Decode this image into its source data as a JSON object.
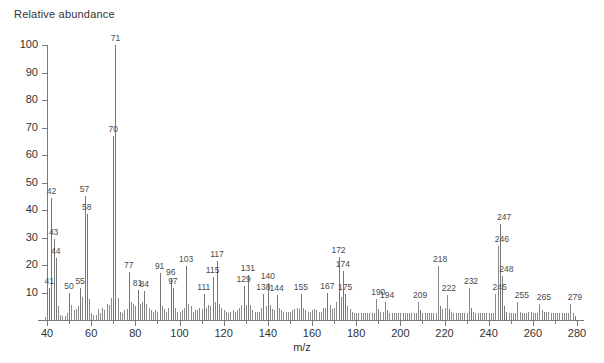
{
  "chart_data": {
    "type": "bar",
    "title": "",
    "ylabel": "Relative abundance",
    "xlabel": "m/z",
    "xlim": [
      36,
      284
    ],
    "ylim": [
      0,
      100
    ],
    "grid": false,
    "legend": null,
    "xticks": [
      40,
      60,
      80,
      100,
      120,
      140,
      160,
      180,
      200,
      220,
      240,
      260,
      280
    ],
    "yticks": [
      0,
      10,
      20,
      30,
      40,
      50,
      60,
      70,
      80,
      90,
      100
    ],
    "x": [
      39,
      40,
      41,
      42,
      43,
      44,
      45,
      46,
      47,
      48,
      49,
      50,
      51,
      52,
      53,
      54,
      55,
      56,
      57,
      58,
      59,
      60,
      61,
      62,
      63,
      64,
      65,
      66,
      67,
      68,
      69,
      70,
      71,
      72,
      73,
      74,
      75,
      76,
      77,
      78,
      79,
      80,
      81,
      82,
      83,
      84,
      85,
      86,
      87,
      88,
      89,
      90,
      91,
      92,
      93,
      94,
      95,
      96,
      97,
      98,
      99,
      100,
      101,
      102,
      103,
      104,
      105,
      106,
      107,
      108,
      109,
      110,
      111,
      112,
      113,
      114,
      115,
      116,
      117,
      118,
      119,
      120,
      121,
      122,
      123,
      124,
      125,
      126,
      127,
      128,
      129,
      130,
      131,
      132,
      133,
      134,
      135,
      136,
      137,
      138,
      139,
      140,
      141,
      142,
      143,
      144,
      145,
      146,
      147,
      148,
      149,
      150,
      151,
      152,
      153,
      154,
      155,
      156,
      157,
      158,
      159,
      160,
      161,
      162,
      163,
      164,
      165,
      166,
      167,
      168,
      169,
      170,
      171,
      172,
      173,
      174,
      175,
      176,
      177,
      178,
      179,
      180,
      181,
      182,
      183,
      184,
      185,
      186,
      187,
      188,
      189,
      190,
      191,
      192,
      193,
      194,
      195,
      196,
      197,
      198,
      199,
      200,
      201,
      202,
      203,
      204,
      205,
      206,
      207,
      208,
      209,
      210,
      211,
      212,
      213,
      214,
      215,
      216,
      217,
      218,
      219,
      220,
      221,
      222,
      223,
      224,
      225,
      226,
      227,
      228,
      229,
      230,
      231,
      232,
      233,
      234,
      235,
      236,
      237,
      238,
      239,
      240,
      241,
      242,
      243,
      244,
      245,
      246,
      247,
      248,
      249,
      250,
      251,
      252,
      253,
      254,
      255,
      256,
      257,
      258,
      259,
      260,
      261,
      262,
      263,
      264,
      265,
      266,
      267,
      268,
      269,
      270,
      271,
      272,
      273,
      274,
      275,
      276,
      277,
      278,
      279,
      280,
      281
    ],
    "y": [
      1.2,
      2.0,
      11.5,
      44.5,
      29.5,
      22.5,
      5.0,
      2.0,
      1.5,
      1.5,
      2.5,
      10.0,
      5.5,
      3.5,
      4.0,
      5.0,
      11.5,
      8.5,
      45.0,
      38.5,
      7.5,
      2.5,
      2.0,
      2.0,
      4.0,
      2.5,
      4.5,
      3.5,
      6.0,
      5.5,
      8.0,
      67.0,
      100.0,
      8.0,
      3.0,
      2.5,
      3.5,
      4.0,
      17.5,
      6.5,
      6.0,
      5.0,
      11.0,
      6.0,
      6.5,
      10.5,
      6.0,
      4.5,
      3.5,
      3.0,
      3.5,
      3.0,
      17.0,
      5.0,
      4.0,
      3.0,
      4.5,
      15.0,
      11.5,
      4.5,
      3.0,
      3.0,
      3.5,
      4.5,
      19.5,
      6.0,
      5.0,
      3.0,
      3.5,
      3.5,
      4.5,
      4.0,
      9.5,
      4.5,
      5.5,
      5.0,
      15.5,
      6.5,
      21.5,
      6.0,
      4.5,
      3.5,
      3.0,
      2.5,
      3.0,
      3.5,
      3.0,
      3.5,
      4.5,
      5.5,
      12.5,
      5.5,
      16.5,
      5.5,
      3.5,
      3.0,
      3.0,
      3.0,
      4.5,
      9.5,
      5.0,
      13.5,
      5.5,
      4.0,
      3.5,
      9.0,
      4.5,
      3.5,
      3.0,
      3.0,
      3.0,
      3.0,
      3.5,
      4.0,
      4.5,
      4.0,
      9.5,
      4.5,
      3.5,
      3.0,
      3.0,
      3.5,
      4.0,
      3.5,
      3.0,
      3.0,
      4.5,
      4.5,
      10.0,
      5.5,
      4.0,
      4.5,
      6.5,
      23.0,
      8.5,
      18.0,
      9.5,
      5.0,
      4.0,
      3.0,
      2.5,
      2.5,
      2.5,
      2.5,
      2.5,
      2.5,
      2.5,
      2.5,
      2.5,
      2.5,
      7.5,
      4.0,
      3.0,
      3.0,
      6.5,
      3.5,
      2.5,
      2.5,
      2.5,
      2.5,
      2.5,
      2.5,
      2.5,
      2.5,
      2.5,
      2.5,
      2.5,
      2.5,
      2.5,
      6.5,
      3.5,
      2.5,
      2.5,
      2.5,
      2.5,
      2.5,
      2.5,
      2.5,
      19.5,
      5.0,
      4.0,
      4.5,
      9.0,
      4.0,
      3.0,
      2.5,
      2.5,
      2.5,
      2.5,
      2.5,
      2.5,
      2.5,
      11.5,
      4.5,
      3.0,
      2.5,
      2.5,
      2.5,
      2.5,
      2.5,
      2.5,
      2.5,
      2.5,
      2.5,
      9.5,
      27.0,
      35.0,
      16.0,
      5.0,
      3.0,
      2.5,
      2.5,
      2.5,
      2.5,
      6.5,
      3.0,
      2.5,
      2.5,
      2.5,
      3.0,
      3.0,
      2.5,
      2.5,
      2.5,
      6.0,
      3.5,
      3.0,
      3.0,
      3.0,
      2.5,
      2.5,
      2.5,
      2.5,
      2.5,
      2.5,
      2.5,
      2.5,
      2.5,
      6.0,
      2.5,
      1.5
    ],
    "labeled_peaks": [
      {
        "mz": 41,
        "intensity": 11.5
      },
      {
        "mz": 42,
        "intensity": 44.5
      },
      {
        "mz": 43,
        "intensity": 29.5
      },
      {
        "mz": 44,
        "intensity": 22.5
      },
      {
        "mz": 50,
        "intensity": 10.0
      },
      {
        "mz": 55,
        "intensity": 11.5
      },
      {
        "mz": 57,
        "intensity": 45.0
      },
      {
        "mz": 58,
        "intensity": 38.5
      },
      {
        "mz": 70,
        "intensity": 67.0
      },
      {
        "mz": 71,
        "intensity": 100.0
      },
      {
        "mz": 77,
        "intensity": 17.5
      },
      {
        "mz": 81,
        "intensity": 11.0
      },
      {
        "mz": 84,
        "intensity": 10.5
      },
      {
        "mz": 91,
        "intensity": 17.0
      },
      {
        "mz": 96,
        "intensity": 15.0
      },
      {
        "mz": 97,
        "intensity": 11.5
      },
      {
        "mz": 103,
        "intensity": 19.5
      },
      {
        "mz": 111,
        "intensity": 9.5
      },
      {
        "mz": 115,
        "intensity": 15.5
      },
      {
        "mz": 117,
        "intensity": 21.5
      },
      {
        "mz": 129,
        "intensity": 12.5
      },
      {
        "mz": 131,
        "intensity": 16.5
      },
      {
        "mz": 138,
        "intensity": 9.5
      },
      {
        "mz": 140,
        "intensity": 13.5
      },
      {
        "mz": 144,
        "intensity": 9.0
      },
      {
        "mz": 155,
        "intensity": 9.5
      },
      {
        "mz": 167,
        "intensity": 10.0
      },
      {
        "mz": 172,
        "intensity": 23.0
      },
      {
        "mz": 174,
        "intensity": 18.0
      },
      {
        "mz": 175,
        "intensity": 9.5
      },
      {
        "mz": 190,
        "intensity": 7.5
      },
      {
        "mz": 194,
        "intensity": 6.5
      },
      {
        "mz": 209,
        "intensity": 6.5
      },
      {
        "mz": 218,
        "intensity": 19.5
      },
      {
        "mz": 222,
        "intensity": 9.0
      },
      {
        "mz": 232,
        "intensity": 11.5
      },
      {
        "mz": 245,
        "intensity": 9.5
      },
      {
        "mz": 246,
        "intensity": 27.0
      },
      {
        "mz": 247,
        "intensity": 35.0
      },
      {
        "mz": 248,
        "intensity": 16.0
      },
      {
        "mz": 255,
        "intensity": 6.5
      },
      {
        "mz": 265,
        "intensity": 6.0
      },
      {
        "mz": 279,
        "intensity": 6.0
      }
    ]
  },
  "axes": {
    "y_title": "Relative abundance",
    "x_title": "m/z"
  },
  "colors": {
    "peak": "#8a8a8a",
    "axis": "#7a7a7a",
    "text": "#333333",
    "label": "#4a4a4a",
    "background": "#ffffff"
  }
}
